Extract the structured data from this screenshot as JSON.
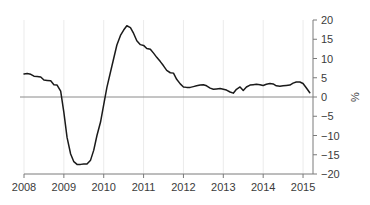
{
  "chart_data": {
    "type": "line",
    "title": "",
    "subtitle": "",
    "xlabel": "",
    "ylabel": "%",
    "ylim": [
      -20,
      20
    ],
    "xlim": [
      2008.0,
      2015.25
    ],
    "grid": "vertical-only",
    "legend": "none",
    "zero_line": 0,
    "y_ticks": [
      20,
      15,
      10,
      5,
      0,
      -5,
      -10,
      -15,
      -20
    ],
    "y_tick_labels": [
      "20",
      "15",
      "10",
      "5",
      "0",
      "−5",
      "−10",
      "−15",
      "−20"
    ],
    "x_ticks": [
      2008,
      2009,
      2010,
      2011,
      2012,
      2013,
      2014,
      2015
    ],
    "x_tick_labels": [
      "2008",
      "2009",
      "2010",
      "2011",
      "2012",
      "2013",
      "2014",
      "2015"
    ],
    "line_color": "#1a1a1a",
    "grid_color": "#ebebeb",
    "axis_color": "#7a7a7a",
    "zero_line_color": "#8a8a8a",
    "series": [
      {
        "name": "value",
        "x": [
          2008.0,
          2008.08,
          2008.17,
          2008.25,
          2008.33,
          2008.42,
          2008.5,
          2008.58,
          2008.67,
          2008.75,
          2008.83,
          2008.92,
          2009.0,
          2009.08,
          2009.17,
          2009.25,
          2009.33,
          2009.42,
          2009.5,
          2009.58,
          2009.67,
          2009.75,
          2009.83,
          2009.92,
          2010.0,
          2010.08,
          2010.17,
          2010.25,
          2010.33,
          2010.42,
          2010.5,
          2010.58,
          2010.67,
          2010.75,
          2010.83,
          2010.92,
          2011.0,
          2011.08,
          2011.17,
          2011.25,
          2011.33,
          2011.42,
          2011.5,
          2011.58,
          2011.67,
          2011.75,
          2011.83,
          2011.92,
          2012.0,
          2012.08,
          2012.17,
          2012.25,
          2012.33,
          2012.42,
          2012.5,
          2012.58,
          2012.67,
          2012.75,
          2012.83,
          2012.92,
          2013.0,
          2013.08,
          2013.17,
          2013.25,
          2013.33,
          2013.42,
          2013.5,
          2013.58,
          2013.67,
          2013.75,
          2013.83,
          2013.92,
          2014.0,
          2014.08,
          2014.17,
          2014.25,
          2014.33,
          2014.42,
          2014.5,
          2014.58,
          2014.67,
          2014.75,
          2014.83,
          2014.92,
          2015.0,
          2015.08,
          2015.17
        ],
        "values": [
          6.0,
          6.1,
          5.9,
          5.4,
          5.3,
          5.2,
          4.4,
          4.3,
          4.2,
          3.2,
          3.1,
          1.5,
          -4.0,
          -10.5,
          -14.8,
          -16.8,
          -17.5,
          -17.5,
          -17.4,
          -17.4,
          -16.4,
          -13.8,
          -10.0,
          -6.5,
          -2.0,
          2.5,
          6.5,
          10.0,
          13.5,
          16.0,
          17.4,
          18.5,
          18.0,
          16.5,
          14.6,
          13.6,
          13.4,
          12.6,
          12.4,
          11.4,
          10.3,
          9.2,
          8.1,
          6.9,
          6.3,
          6.2,
          4.6,
          3.4,
          2.6,
          2.5,
          2.5,
          2.7,
          2.9,
          3.1,
          3.2,
          2.9,
          2.3,
          2.0,
          2.1,
          2.2,
          2.0,
          1.8,
          1.3,
          1.0,
          2.0,
          2.6,
          1.7,
          2.6,
          3.1,
          3.2,
          3.3,
          3.2,
          3.0,
          3.3,
          3.5,
          3.4,
          2.9,
          2.8,
          2.9,
          3.0,
          3.1,
          3.6,
          3.9,
          3.9,
          3.5,
          2.4,
          1.1
        ]
      }
    ]
  }
}
